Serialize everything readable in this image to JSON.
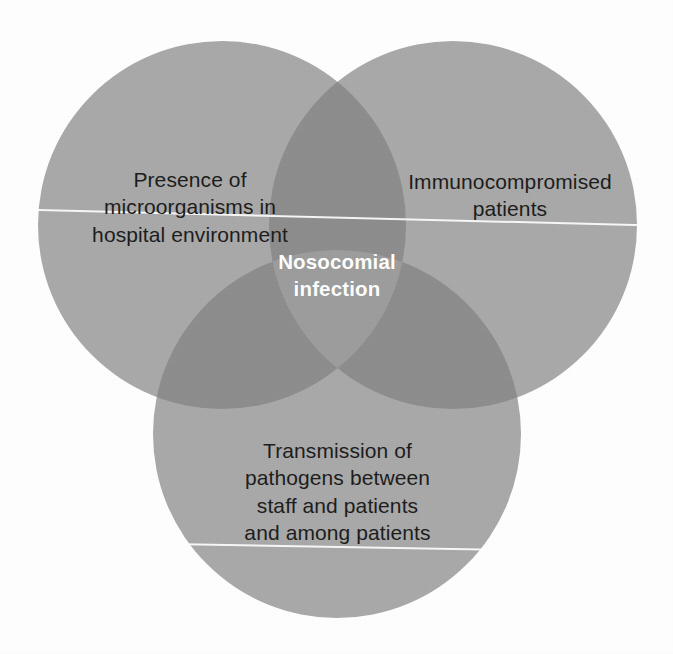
{
  "figure": {
    "kind": "venn-diagram",
    "set_count": 3,
    "canvas": {
      "width": 673,
      "height": 654
    },
    "background_color": "#ffffff"
  },
  "colors": {
    "circle_fill": "#a9a9a9",
    "pair_overlap_fill": "#8d8d8d",
    "triple_overlap_fill": "#9d9d9d",
    "label_text": "#1c1c1c",
    "center_label_text": "#ffffff",
    "scanline": "#ffffff"
  },
  "circles": [
    {
      "id": "microorganisms",
      "position": "top-left",
      "cx": 222,
      "cy": 225,
      "r": 184,
      "label": "Presence of\nmicroorganisms in\nhospital environment"
    },
    {
      "id": "immunocompromised",
      "position": "top-right",
      "cx": 453,
      "cy": 225,
      "r": 184,
      "label": "Immunocompromised\npatients"
    },
    {
      "id": "transmission",
      "position": "bottom",
      "cx": 337,
      "cy": 434,
      "r": 184,
      "label": "Transmission of\npathogens between\nstaff and patients\nand among patients"
    }
  ],
  "intersection": {
    "id": "nosocomial-infection",
    "label": "Nosocomial\ninfection",
    "cx": 337,
    "cy": 288
  },
  "artifacts": {
    "scanlines": [
      {
        "id": "upper",
        "y": 208,
        "angle_deg": 1.45
      },
      {
        "id": "lower",
        "y": 540,
        "angle_deg": 1.0
      }
    ]
  }
}
